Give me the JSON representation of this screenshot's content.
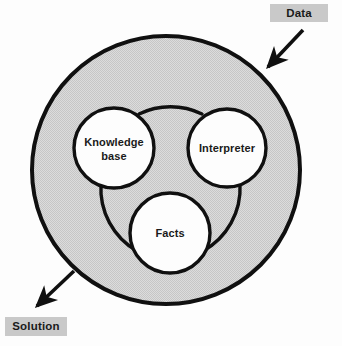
{
  "diagram": {
    "type": "expert-system-architecture",
    "colors": {
      "outer_fill": "#d6d6d6",
      "inner_fill": "#fdfdfd",
      "stroke": "#101010",
      "label_box": "#c9c9c9",
      "text": "#1a1a1a",
      "page_background": "#fdfdfd"
    },
    "outer_shell": {
      "name": "expert-system-boundary",
      "shape": "circle",
      "cx": 166,
      "cy": 170,
      "r": 134,
      "stroke_width": 4
    },
    "inner_link": {
      "name": "connecting-arcs",
      "description": "three concave arcs joining the three component circles into a rounded triangle"
    },
    "nodes": [
      {
        "id": "knowledge-base",
        "lines": [
          "Knowledge",
          "base"
        ],
        "cx": 114,
        "cy": 148,
        "r": 40
      },
      {
        "id": "interpreter",
        "lines": [
          "Interpreter"
        ],
        "cx": 227,
        "cy": 148,
        "r": 39
      },
      {
        "id": "facts",
        "lines": [
          "Facts"
        ],
        "cx": 170,
        "cy": 233,
        "r": 40
      }
    ],
    "io_labels": [
      {
        "id": "data",
        "text": "Data",
        "box": {
          "x": 270,
          "y": 4,
          "w": 58,
          "h": 18
        },
        "text_x": 299,
        "text_y": 13,
        "arrow": {
          "name": "data-input-arrow",
          "direction": "inbound",
          "x1": 303,
          "y1": 30,
          "x2": 265,
          "y2": 70
        }
      },
      {
        "id": "solution",
        "text": "Solution",
        "box": {
          "x": 5,
          "y": 317,
          "w": 62,
          "h": 19
        },
        "text_x": 36,
        "text_y": 327,
        "arrow": {
          "name": "solution-output-arrow",
          "direction": "outbound",
          "x1": 74,
          "y1": 271,
          "x2": 33,
          "y2": 310
        }
      }
    ]
  }
}
